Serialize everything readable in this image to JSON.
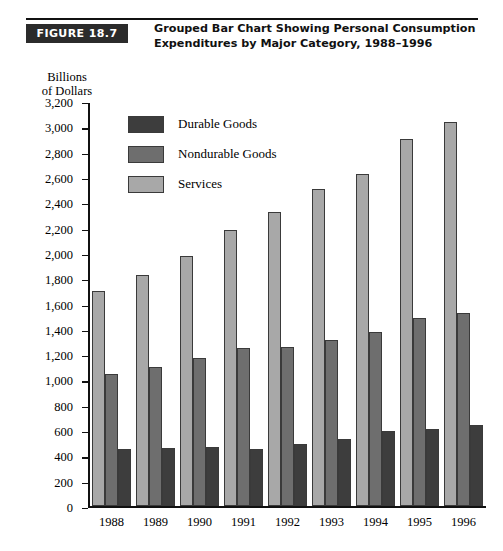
{
  "figure": {
    "badge": "FIGURE 18.7",
    "title_line_1": "Grouped Bar Chart Showing Personal Consumption",
    "title_line_2": "Expenditures by Major Category, 1988–1996"
  },
  "axis_title": {
    "line_1": "Billions",
    "line_2": "of Dollars"
  },
  "colors": {
    "durable": "#3d3d3d",
    "nondurable": "#6e6e6e",
    "services": "#a8a8a8",
    "badge_background": "#2b2b2b",
    "axis": "#111111"
  },
  "chart_data": {
    "type": "bar",
    "title": "Grouped Bar Chart Showing Personal Consumption Expenditures by Major Category, 1988–1996",
    "xlabel": "",
    "ylabel": "Billions of Dollars",
    "ylim": [
      0,
      3200
    ],
    "ytick_step": 200,
    "yticks": [
      0,
      200,
      400,
      600,
      800,
      1000,
      1200,
      1400,
      1600,
      1800,
      2000,
      2200,
      2400,
      2600,
      2800,
      3000,
      3200
    ],
    "ytick_labels": [
      "0",
      "200",
      "400",
      "600",
      "800",
      "1,000",
      "1,200",
      "1,400",
      "1,600",
      "1,800",
      "2,000",
      "2,200",
      "2,400",
      "2,600",
      "2,800",
      "3,000",
      "3,200"
    ],
    "categories": [
      "1988",
      "1989",
      "1990",
      "1991",
      "1992",
      "1993",
      "1994",
      "1995",
      "1996"
    ],
    "grid": false,
    "legend_position": "inside-upper-left",
    "bar_order_in_group": [
      "Services",
      "Nondurable Goods",
      "Durable Goods"
    ],
    "series": [
      {
        "name": "Durable Goods",
        "color": "#3d3d3d",
        "values": [
          450,
          460,
          470,
          450,
          490,
          530,
          595,
          615,
          645
        ]
      },
      {
        "name": "Nondurable Goods",
        "color": "#6e6e6e",
        "values": [
          1050,
          1105,
          1175,
          1250,
          1260,
          1315,
          1380,
          1485,
          1530
        ]
      },
      {
        "name": "Services",
        "color": "#a8a8a8",
        "values": [
          1700,
          1830,
          1975,
          2185,
          2325,
          2510,
          2630,
          2900,
          3040
        ]
      }
    ]
  }
}
